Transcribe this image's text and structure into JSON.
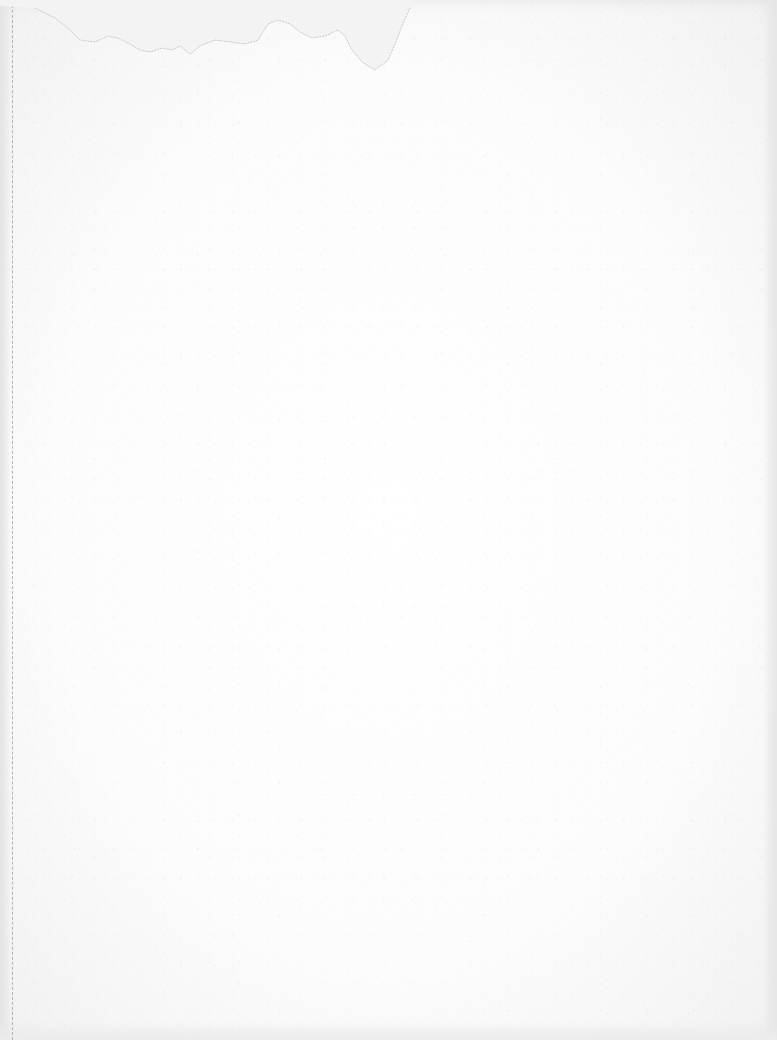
{
  "document": {
    "type": "blank-sheet",
    "text": "",
    "features": {
      "torn_top_edge": true,
      "left_perforation": true
    }
  },
  "colors": {
    "paper": "#fdfdfd",
    "background": "#e9e9e9",
    "perforation": "#b5b5b5",
    "torn_line": "#c8c8c8"
  }
}
